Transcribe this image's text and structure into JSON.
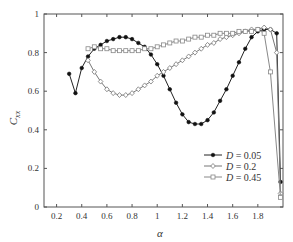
{
  "chart_data": {
    "type": "line",
    "title": "",
    "xlabel": "α",
    "ylabel": "C_xx",
    "ylabel_main": "C",
    "ylabel_sub": "xx",
    "xlim": [
      0.1,
      2.0
    ],
    "ylim": [
      0,
      1
    ],
    "xticks": [
      0.2,
      0.4,
      0.6,
      0.8,
      1,
      1.2,
      1.4,
      1.6,
      1.8
    ],
    "xtick_labels": [
      "0.2",
      "0.4",
      "0.6",
      "0.8",
      "1",
      "1.2",
      "1.4",
      "1.6",
      "1.8"
    ],
    "yticks": [
      0,
      0.2,
      0.4,
      0.6,
      0.8,
      1
    ],
    "ytick_labels": [
      "0",
      "0.2",
      "0.4",
      "0.6",
      "0.8",
      "1"
    ],
    "grid": false,
    "legend_position": "lower right",
    "series": [
      {
        "name": "D = 0.05",
        "label_var": "D",
        "label_val": "= 0.05",
        "marker": "star-filled",
        "color": "#222222",
        "x": [
          0.3,
          0.35,
          0.4,
          0.45,
          0.5,
          0.55,
          0.6,
          0.65,
          0.7,
          0.75,
          0.8,
          0.85,
          0.9,
          0.95,
          1.0,
          1.05,
          1.1,
          1.15,
          1.2,
          1.25,
          1.3,
          1.35,
          1.4,
          1.45,
          1.5,
          1.55,
          1.6,
          1.65,
          1.7,
          1.75,
          1.8,
          1.85,
          1.9,
          1.95,
          1.98
        ],
        "y": [
          0.69,
          0.59,
          0.72,
          0.78,
          0.82,
          0.84,
          0.86,
          0.87,
          0.88,
          0.88,
          0.87,
          0.85,
          0.83,
          0.79,
          0.74,
          0.68,
          0.61,
          0.54,
          0.48,
          0.44,
          0.43,
          0.43,
          0.45,
          0.49,
          0.55,
          0.61,
          0.68,
          0.75,
          0.82,
          0.88,
          0.91,
          0.92,
          0.92,
          0.9,
          0.13
        ]
      },
      {
        "name": "D = 0.2",
        "label_var": "D",
        "label_val": "= 0.2",
        "marker": "diamond-open",
        "color": "#777777",
        "x": [
          0.45,
          0.5,
          0.55,
          0.6,
          0.65,
          0.7,
          0.75,
          0.8,
          0.85,
          0.9,
          0.95,
          1.0,
          1.05,
          1.1,
          1.15,
          1.2,
          1.25,
          1.3,
          1.35,
          1.4,
          1.45,
          1.5,
          1.55,
          1.6,
          1.65,
          1.7,
          1.75,
          1.8,
          1.85,
          1.9,
          1.95,
          1.98
        ],
        "y": [
          0.76,
          0.7,
          0.65,
          0.61,
          0.59,
          0.58,
          0.58,
          0.59,
          0.61,
          0.63,
          0.65,
          0.68,
          0.7,
          0.72,
          0.74,
          0.76,
          0.78,
          0.8,
          0.82,
          0.84,
          0.85,
          0.87,
          0.88,
          0.89,
          0.9,
          0.91,
          0.92,
          0.92,
          0.93,
          0.92,
          0.8,
          0.07
        ]
      },
      {
        "name": "D = 0.45",
        "label_var": "D",
        "label_val": "= 0.45",
        "marker": "square-open",
        "color": "#888888",
        "x": [
          0.45,
          0.5,
          0.55,
          0.6,
          0.65,
          0.7,
          0.75,
          0.8,
          0.85,
          0.9,
          0.95,
          1.0,
          1.05,
          1.1,
          1.15,
          1.2,
          1.25,
          1.3,
          1.35,
          1.4,
          1.45,
          1.5,
          1.55,
          1.6,
          1.65,
          1.7,
          1.75,
          1.8,
          1.85,
          1.9,
          1.98
        ],
        "y": [
          0.82,
          0.83,
          0.82,
          0.82,
          0.81,
          0.81,
          0.81,
          0.81,
          0.81,
          0.82,
          0.82,
          0.83,
          0.84,
          0.85,
          0.86,
          0.86,
          0.87,
          0.88,
          0.88,
          0.89,
          0.89,
          0.9,
          0.9,
          0.9,
          0.91,
          0.91,
          0.91,
          0.92,
          0.9,
          0.7,
          0.05
        ]
      }
    ]
  }
}
